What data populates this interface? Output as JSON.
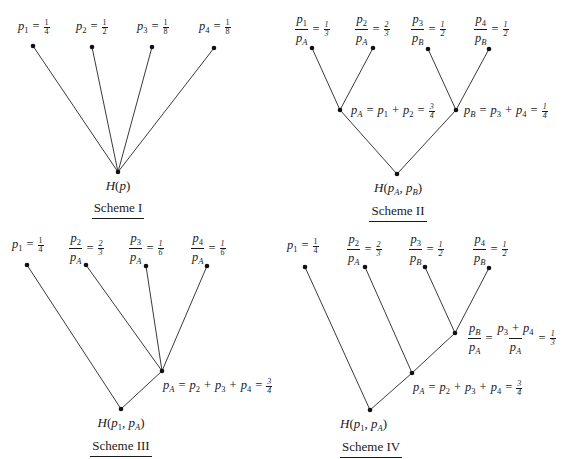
{
  "schemes": [
    {
      "id": "I",
      "title": "Scheme I",
      "root_label": "H(p)",
      "leaves": [
        {
          "var": "p",
          "sub": "1",
          "value_num": "1",
          "value_den": "4"
        },
        {
          "var": "p",
          "sub": "2",
          "value_num": "1",
          "value_den": "2"
        },
        {
          "var": "p",
          "sub": "3",
          "value_num": "1",
          "value_den": "8"
        },
        {
          "var": "p",
          "sub": "4",
          "value_num": "1",
          "value_den": "8"
        }
      ]
    },
    {
      "id": "II",
      "title": "Scheme II",
      "root_label": "H(pA, pB)",
      "leaves": [
        {
          "num": "p1",
          "den": "pA",
          "value_num": "1",
          "value_den": "3"
        },
        {
          "num": "p2",
          "den": "pA",
          "value_num": "2",
          "value_den": "3"
        },
        {
          "num": "p3",
          "den": "pB",
          "value_num": "1",
          "value_den": "2"
        },
        {
          "num": "p4",
          "den": "pB",
          "value_num": "1",
          "value_den": "2"
        }
      ],
      "internal_nodes": [
        {
          "label": "pA = p1 + p2 = 3/4",
          "value_num": "3",
          "value_den": "4"
        },
        {
          "label": "pB = p3 + p4 = 1/4",
          "value_num": "1",
          "value_den": "4"
        }
      ]
    },
    {
      "id": "III",
      "title": "Scheme III",
      "root_label": "H(p1, pA)",
      "leaves": [
        {
          "var": "p",
          "sub": "1",
          "value_num": "1",
          "value_den": "4"
        },
        {
          "num": "p2",
          "den": "pA",
          "value_num": "2",
          "value_den": "3"
        },
        {
          "num": "p3",
          "den": "pA",
          "value_num": "1",
          "value_den": "6"
        },
        {
          "num": "p4",
          "den": "pA",
          "value_num": "1",
          "value_den": "6"
        }
      ],
      "internal_nodes": [
        {
          "label": "pA = p2 + p3 + p4 = 3/4",
          "value_num": "3",
          "value_den": "4"
        }
      ]
    },
    {
      "id": "IV",
      "title": "Scheme IV",
      "root_label": "H(p1, pA)",
      "leaves": [
        {
          "var": "p",
          "sub": "1",
          "value_num": "1",
          "value_den": "4"
        },
        {
          "num": "p2",
          "den": "pA",
          "value_num": "2",
          "value_den": "3"
        },
        {
          "num": "p3",
          "den": "pB",
          "value_num": "1",
          "value_den": "2"
        },
        {
          "num": "p4",
          "den": "pB",
          "value_num": "1",
          "value_den": "2"
        }
      ],
      "internal_nodes": [
        {
          "label": "pB/pA = (p3 + p4)/pA = 1/3",
          "value_num": "1",
          "value_den": "3"
        },
        {
          "label": "pA = p2 + p3 + p4 = 3/4",
          "value_num": "3",
          "value_den": "4"
        }
      ]
    }
  ],
  "common": {
    "H": "H",
    "p": "p",
    "eq": "=",
    "plus": "+",
    "comma": ",",
    "lparen": "(",
    "rparen": ")",
    "sub1": "1",
    "sub2": "2",
    "sub3": "3",
    "sub4": "4",
    "subA": "A",
    "subB": "B"
  },
  "colors": {
    "line": "#3a3a3a",
    "node": "#111111",
    "text": "#1a1a1a"
  }
}
